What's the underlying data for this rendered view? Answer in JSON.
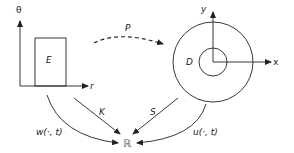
{
  "diagram": {
    "left_panel": {
      "vertical_axis_label": "θ",
      "horizontal_axis_label": "r",
      "region_label": "E"
    },
    "right_panel": {
      "vertical_axis_label": "y",
      "horizontal_axis_label": "x",
      "region_label": "D"
    },
    "arrows": {
      "top_map": "P",
      "left_diag": "K",
      "right_diag": "S",
      "left_outer": "w(·, t)",
      "right_outer": "u(·, t)"
    },
    "target": "ℝ",
    "colors": {
      "stroke": "#222222",
      "background": "#ffffff"
    }
  }
}
